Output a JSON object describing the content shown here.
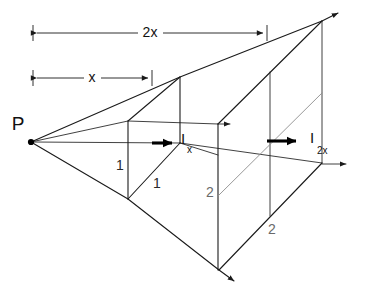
{
  "figure": {
    "source_point": {
      "label": "P",
      "x": 31,
      "y": 142
    },
    "dimensions": [
      {
        "name": "x",
        "label": "x",
        "x1": 33,
        "x2": 152,
        "y": 78,
        "label_x": 92,
        "label_y": 78
      },
      {
        "name": "2x",
        "label": "2x",
        "x1": 33,
        "x2": 267,
        "y": 33,
        "label_x": 150,
        "label_y": 33
      }
    ],
    "intensity_labels": [
      {
        "name": "I-x",
        "base": "I",
        "subscript": "x",
        "base_x": 181,
        "base_y": 140,
        "sub_x": 187,
        "sub_y": 149
      },
      {
        "name": "I-2x",
        "base": "I",
        "subscript": "2x",
        "base_x": 310,
        "base_y": 139,
        "sub_x": 317,
        "sub_y": 150
      }
    ],
    "side_labels": [
      {
        "name": "near-square-vertical",
        "text": "1",
        "x": 120,
        "y": 166
      },
      {
        "name": "near-square-depth",
        "text": "1",
        "x": 157,
        "y": 184
      },
      {
        "name": "far-square-vertical",
        "text": "2",
        "x": 210,
        "y": 193
      },
      {
        "name": "far-square-depth",
        "text": "2",
        "x": 272,
        "y": 230
      }
    ],
    "near_square": {
      "name": "unit-square-at-x",
      "side": 1,
      "top_left": {
        "x": 128,
        "y": 121
      },
      "top_right": {
        "x": 180,
        "y": 77
      },
      "bottom_right": {
        "x": 180,
        "y": 143
      },
      "bottom_left": {
        "x": 128,
        "y": 199
      }
    },
    "far_square": {
      "name": "four-unit-square-at-2x",
      "side": 2,
      "top_left": {
        "x": 218,
        "y": 124
      },
      "top_right": {
        "x": 322,
        "y": 21
      },
      "bottom_right": {
        "x": 322,
        "y": 163
      },
      "bottom_left": {
        "x": 218,
        "y": 270
      }
    },
    "flux_arrows": [
      {
        "name": "flux-arrow-x",
        "x1": 152,
        "x2": 180,
        "y": 143,
        "weight": "bold"
      },
      {
        "name": "flux-arrow-2x",
        "x1": 267,
        "x2": 305,
        "y": 141,
        "weight": "bold"
      },
      {
        "name": "ray-arrow-top-near",
        "x1": 218,
        "x2": 234,
        "y": 124,
        "weight": "thin"
      },
      {
        "name": "ray-arrow-bottom-far",
        "x1": 322,
        "x2": 350,
        "y": 164,
        "weight": "thin"
      }
    ]
  }
}
